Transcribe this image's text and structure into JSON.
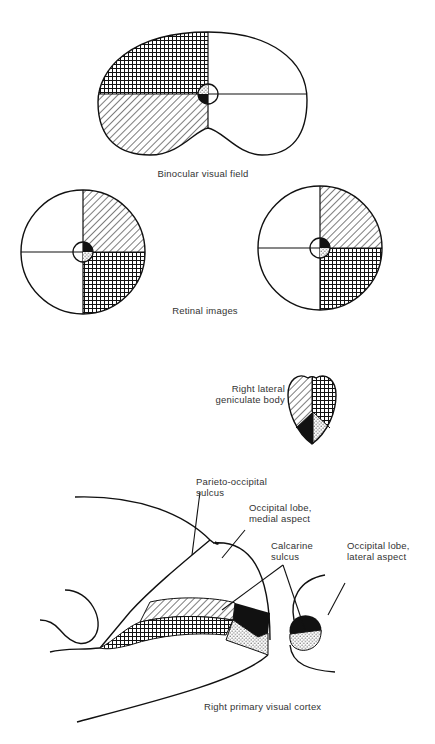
{
  "figure": {
    "panels": [
      {
        "id": "binocular_visual_field",
        "caption": "Binocular visual field"
      },
      {
        "id": "retinal_images",
        "caption": "Retinal images"
      },
      {
        "id": "lgn",
        "label_line1": "Right lateral",
        "label_line2": "geniculate body"
      },
      {
        "id": "cortex",
        "caption": "Right primary visual cortex"
      }
    ],
    "cortex_labels": {
      "parieto_occipital_1": "Parieto-occipital",
      "parieto_occipital_2": "sulcus",
      "medial_1": "Occipital lobe,",
      "medial_2": "medial aspect",
      "calcarine_1": "Calcarine",
      "calcarine_2": "sulcus",
      "lateral_1": "Occipital lobe,",
      "lateral_2": "lateral aspect"
    },
    "legend_patterns": {
      "upper_left_field": "crosshatch",
      "lower_left_field": "diagonal-hatch",
      "macula_upper": "stipple",
      "macula_lower": "solid-black"
    },
    "colors": {
      "ink": "#1a1a1a",
      "paper": "#ffffff"
    }
  }
}
